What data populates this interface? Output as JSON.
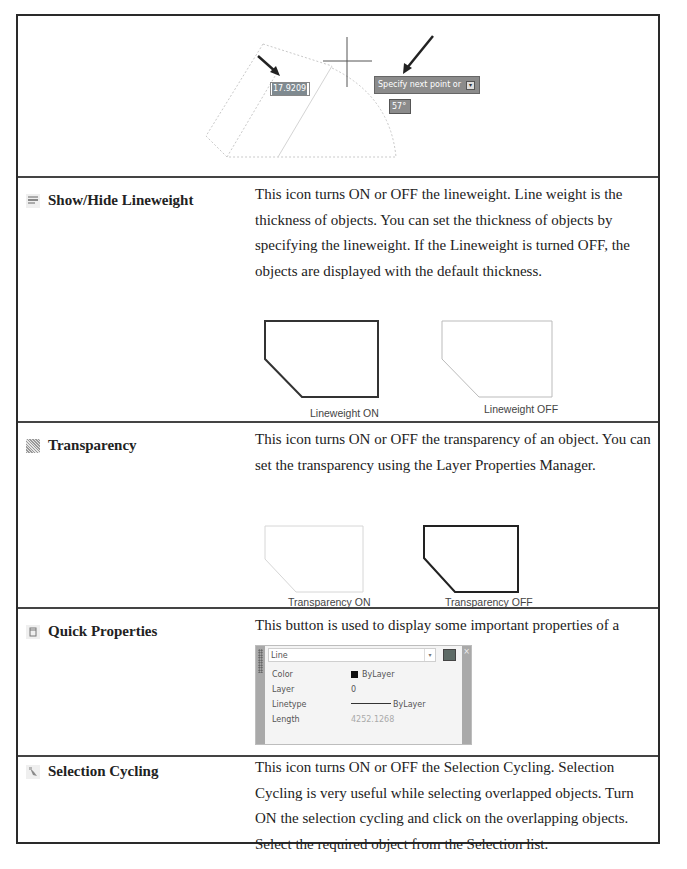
{
  "figure_top": {
    "dimension_value": "17.9209",
    "tooltip_text": "Specify next point or",
    "tooltip_button": "▾",
    "angle_value": "57°"
  },
  "rows": [
    {
      "name": "Show/Hide Lineweight",
      "icon": "lineweight-icon",
      "description": "This icon turns ON or OFF the lineweight. Line weight is the thickness of objects. You can set the thickness of objects by specifying the lineweight. If the Lineweight is turned OFF, the objects are displayed with the default thickness.",
      "figures": [
        {
          "caption": "Lineweight ON",
          "style": "thick"
        },
        {
          "caption": "Lineweight OFF",
          "style": "thin"
        }
      ]
    },
    {
      "name": "Transparency",
      "icon": "transparency-icon",
      "description": "This icon turns ON or OFF the transparency of an object. You can set the transparency using the Layer Properties Manager.",
      "figures": [
        {
          "caption": "Transparency ON",
          "style": "faint"
        },
        {
          "caption": "Transparency OFF",
          "style": "thick"
        }
      ]
    },
    {
      "name": "Quick Properties",
      "icon": "quick-properties-icon",
      "description": "This button is used to display some important properties of a selected object.",
      "panel": {
        "object_type": "Line",
        "properties": [
          {
            "label": "Color",
            "value": "ByLayer"
          },
          {
            "label": "Layer",
            "value": "0"
          },
          {
            "label": "Linetype",
            "value": "ByLayer"
          },
          {
            "label": "Length",
            "value": "4252.1268"
          }
        ]
      }
    },
    {
      "name": "Selection Cycling",
      "icon": "selection-cycling-icon",
      "description": "This icon turns ON or OFF the Selection Cycling. Selection Cycling is very useful while selecting overlapped objects. Turn ON the selection cycling and click on the overlapping objects. Select the required object from the Selection list."
    }
  ]
}
